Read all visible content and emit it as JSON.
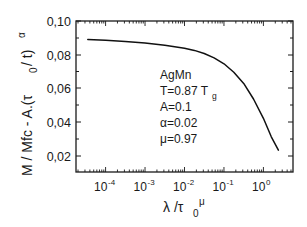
{
  "chart_data": {
    "type": "line",
    "title": "",
    "xlabel": "λ /τ0^μ",
    "ylabel": "M / Mfc - A.(τ0 / t)^α",
    "xscale": "log",
    "xlim_log10": [
      -4.75,
      0.75
    ],
    "ylim": [
      0.01,
      0.1
    ],
    "grid": false,
    "legend": null,
    "x_ticks": [
      "10^-4",
      "10^-3",
      "10^-2",
      "10^-1",
      "10^0"
    ],
    "y_ticks": [
      "0,02",
      "0,04",
      "0,06",
      "0,08",
      "0,10"
    ],
    "annotations": [
      "AgMn",
      "T=0.87 Tg",
      "A=0.1",
      "α=0.02",
      "μ=0.97"
    ],
    "series": [
      {
        "name": "AgMn scaling curve",
        "x_log10": [
          -4.45,
          -4.0,
          -3.5,
          -3.0,
          -2.5,
          -2.0,
          -1.75,
          -1.5,
          -1.25,
          -1.0,
          -0.75,
          -0.5,
          -0.25,
          0.0,
          0.2,
          0.38
        ],
        "y": [
          0.089,
          0.0885,
          0.0878,
          0.0868,
          0.0856,
          0.0838,
          0.0825,
          0.0806,
          0.078,
          0.0745,
          0.0695,
          0.0628,
          0.0535,
          0.042,
          0.031,
          0.023
        ]
      }
    ]
  },
  "axes": {
    "y_tick_labels": [
      "0,10",
      "0,08",
      "0,06",
      "0,04",
      "0,02"
    ],
    "x_tick_base": "10",
    "x_tick_exps": [
      "-4",
      "-3",
      "-2",
      "-1",
      "0"
    ],
    "ylabel_parts": {
      "main": "M / Mfc - A.(τ",
      "sub0": "0",
      "mid": " / t)",
      "sup": "α"
    },
    "xlabel_parts": {
      "main": "λ /τ",
      "sub0": "0",
      "sup": "μ"
    }
  },
  "annotation_block": {
    "line1": "AgMn",
    "line2_main": "T=0.87 T",
    "line2_sub": "g",
    "line3": "A=0.1",
    "line4": "α=0.02",
    "line5": "μ=0.97"
  }
}
